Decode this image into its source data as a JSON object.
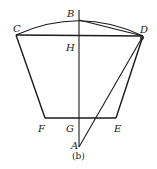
{
  "figure": {
    "caption": "(b)",
    "points": {
      "A": {
        "label": "A",
        "x": 79,
        "y": 147
      },
      "B": {
        "label": "B",
        "x": 79,
        "y": 20
      },
      "C": {
        "label": "C",
        "x": 16,
        "y": 35
      },
      "D": {
        "label": "D",
        "x": 143,
        "y": 36
      },
      "E": {
        "label": "E",
        "x": 116,
        "y": 118
      },
      "F": {
        "label": "F",
        "x": 45,
        "y": 118
      },
      "G": {
        "label": "G",
        "x": 79,
        "y": 118
      },
      "H": {
        "label": "H",
        "x": 79,
        "y": 36
      }
    },
    "segments": [
      [
        "C",
        "D"
      ],
      [
        "C",
        "F"
      ],
      [
        "F",
        "E"
      ],
      [
        "E",
        "D"
      ],
      [
        "B",
        "D"
      ],
      [
        "A",
        "D"
      ],
      [
        "B",
        "A"
      ]
    ],
    "arcs": [
      [
        "C",
        "B",
        "D"
      ]
    ],
    "stroke_color": "#1a1a1a"
  }
}
